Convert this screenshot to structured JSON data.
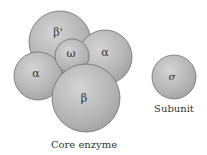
{
  "diagram": {
    "core_enzyme": {
      "caption": "Core enzyme",
      "subunits": [
        {
          "id": "beta-prime",
          "label": "β'"
        },
        {
          "id": "alpha-right",
          "label": "α"
        },
        {
          "id": "alpha-left",
          "label": "α"
        },
        {
          "id": "omega",
          "label": "ω"
        },
        {
          "id": "beta",
          "label": "β"
        }
      ]
    },
    "sigma": {
      "label": "σ",
      "caption": "Subunit"
    },
    "colors": {
      "sphere_fill": "#b8b8b8",
      "sphere_highlight": "#d6d6d6",
      "sphere_outline": "#6e6e6e"
    }
  }
}
